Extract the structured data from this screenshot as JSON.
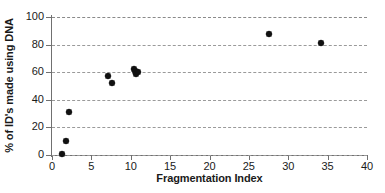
{
  "chart_data": {
    "type": "scatter",
    "title": "",
    "xlabel": "Fragmentation Index",
    "ylabel": "% of ID's made using DNA",
    "xlim": [
      0,
      40
    ],
    "ylim": [
      0,
      100
    ],
    "xticks": [
      0,
      5,
      10,
      15,
      20,
      25,
      30,
      35,
      40
    ],
    "yticks": [
      0,
      20,
      40,
      60,
      80,
      100
    ],
    "grid": "horizontal-dashed",
    "legend": "none",
    "marker": "diamond",
    "marker_color": "#111111",
    "points": [
      {
        "x": 1.3,
        "y": 0.5
      },
      {
        "x": 1.8,
        "y": 10.0
      },
      {
        "x": 2.1,
        "y": 31.0
      },
      {
        "x": 7.1,
        "y": 57.5
      },
      {
        "x": 7.6,
        "y": 52.0
      },
      {
        "x": 10.4,
        "y": 62.5
      },
      {
        "x": 10.6,
        "y": 61.0
      },
      {
        "x": 10.7,
        "y": 59.0
      },
      {
        "x": 10.9,
        "y": 60.5
      },
      {
        "x": 27.6,
        "y": 88.0
      },
      {
        "x": 34.2,
        "y": 81.5
      }
    ]
  },
  "axis": {
    "x_title": "Fragmentation Index",
    "y_title": "% of ID's made using DNA",
    "x_tick_labels": [
      "0",
      "5",
      "10",
      "15",
      "20",
      "25",
      "30",
      "35",
      "40"
    ],
    "y_tick_labels": [
      "0",
      "20",
      "40",
      "60",
      "80",
      "100"
    ]
  },
  "colors": {
    "marker": "#111111",
    "gridline": "#9a9a9a",
    "axis": "#707070",
    "text": "#1a1a1a",
    "background": "#ffffff"
  }
}
